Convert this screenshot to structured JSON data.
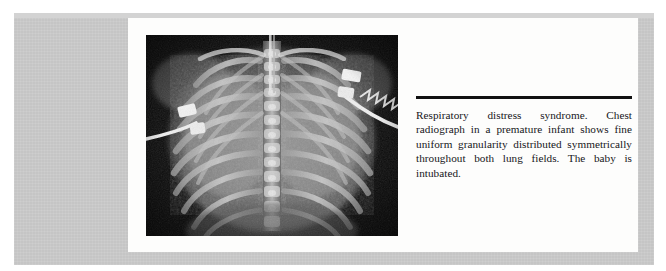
{
  "page": {
    "kind": "scanned-textbook-figure-page",
    "background_color": "#ffffff",
    "scan_backing_color": "#c9c9c9",
    "paper_color": "#fdfdfc"
  },
  "figure": {
    "alt": "Chest radiograph of a premature infant",
    "modality_label": "chest-radiograph",
    "image_background_color": "#0b0b0b",
    "features": [
      "fine uniform granularity",
      "symmetric lung fields",
      "endotracheal tube",
      "ECG leads",
      "skin electrodes"
    ]
  },
  "caption": {
    "rule_color": "#111111",
    "text": "Respiratory distress syndrome. Chest radiograph in a premature infant shows fine uniform granularity distributed symmetrically throughout both lung fields. The baby is intubated."
  }
}
